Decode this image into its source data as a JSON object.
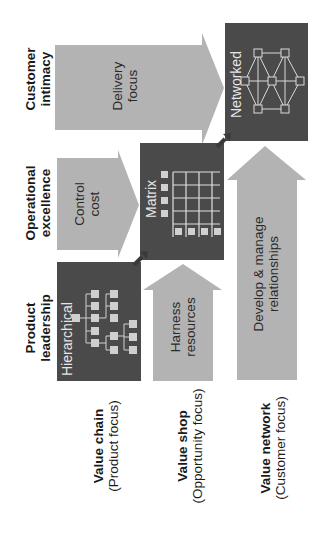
{
  "colors": {
    "arrow_fill": "#b3b3b3",
    "box_fill": "#4a4a4a",
    "box_line": "#d9d9d9",
    "text_dark": "#1a1a1a",
    "text_light": "#e6e6e6"
  },
  "strategies": [
    {
      "id": "customer-intimacy",
      "line1": "Customer",
      "line2": "intimacy"
    },
    {
      "id": "operational-excellence",
      "line1": "Operational",
      "line2": "excellence"
    },
    {
      "id": "product-leadership",
      "line1": "Product",
      "line2": "leadership"
    }
  ],
  "arrows": {
    "delivery": {
      "line1": "Delivery",
      "line2": "focus"
    },
    "control": {
      "line1": "Control",
      "line2": "cost"
    },
    "harness": {
      "line1": "Harness",
      "line2": "resources"
    },
    "develop": {
      "line1": "Develop & manage",
      "line2": "relationships"
    }
  },
  "structures": {
    "networked": {
      "label": "Networked",
      "icon": "network-graph-icon"
    },
    "matrix": {
      "label": "Matrix",
      "icon": "matrix-grid-icon"
    },
    "hierarchical": {
      "label": "Hierarchical",
      "icon": "org-tree-icon"
    }
  },
  "value_configs": [
    {
      "id": "value-chain",
      "title": "Value chain",
      "subtitle": "(Product focus)"
    },
    {
      "id": "value-shop",
      "title": "Value shop",
      "subtitle": "(Opportunity focus)"
    },
    {
      "id": "value-network",
      "title": "Value network",
      "subtitle": "(Customer focus)"
    }
  ]
}
